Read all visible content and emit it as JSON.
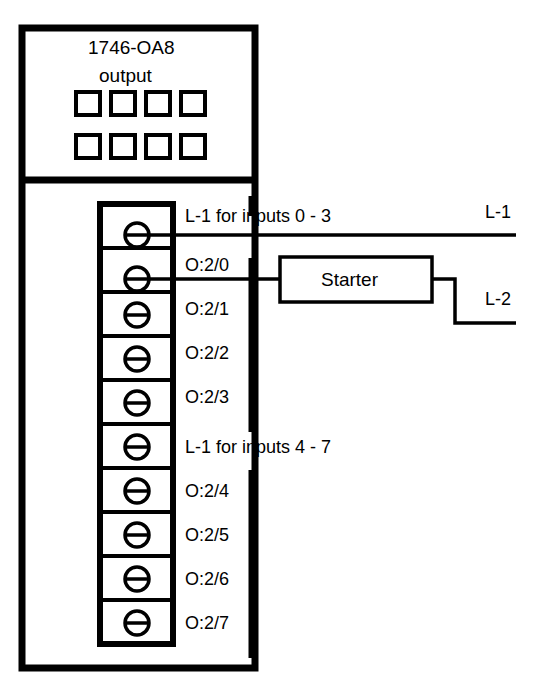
{
  "module": {
    "title": "1746-OA8",
    "subtitle": "output",
    "led_count": 8,
    "led_rows": 2,
    "led_columns": 4
  },
  "terminals": [
    {
      "id": "t0",
      "label": "L-1 for inputs 0 - 3",
      "icon": "screw-terminal-icon",
      "wired": true
    },
    {
      "id": "t1",
      "label": "O:2/0",
      "icon": "screw-terminal-icon",
      "wired": true
    },
    {
      "id": "t2",
      "label": "O:2/1",
      "icon": "screw-terminal-icon",
      "wired": false
    },
    {
      "id": "t3",
      "label": "O:2/2",
      "icon": "screw-terminal-icon",
      "wired": false
    },
    {
      "id": "t4",
      "label": "O:2/3",
      "icon": "screw-terminal-icon",
      "wired": false
    },
    {
      "id": "t5",
      "label": "L-1 for inputs 4 - 7",
      "icon": "screw-terminal-icon",
      "wired": false
    },
    {
      "id": "t6",
      "label": "O:2/4",
      "icon": "screw-terminal-icon",
      "wired": false
    },
    {
      "id": "t7",
      "label": "O:2/5",
      "icon": "screw-terminal-icon",
      "wired": false
    },
    {
      "id": "t8",
      "label": "O:2/6",
      "icon": "screw-terminal-icon",
      "wired": false
    },
    {
      "id": "t9",
      "label": "O:2/7",
      "icon": "screw-terminal-icon",
      "wired": false
    }
  ],
  "devices": [
    {
      "id": "starter",
      "label": "Starter"
    }
  ],
  "rails": [
    {
      "id": "l1",
      "label": "L-1"
    },
    {
      "id": "l2",
      "label": "L-2"
    }
  ],
  "colors": {
    "line": "#000000",
    "background": "#ffffff",
    "text": "#000000"
  }
}
